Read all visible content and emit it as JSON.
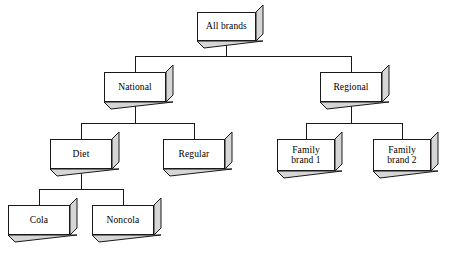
{
  "diagram": {
    "type": "hierarchy-tree",
    "title": "",
    "orientation": "top-down",
    "depth": 4,
    "style": {
      "node_shape": "3d-extruded-box",
      "face_color": "#ffffff",
      "extrude_color": "#d6d6d6",
      "border_color": "#1a1a1a",
      "line_color": "#1a1a1a",
      "extrude_offset_px": 7
    },
    "nodes": [
      {
        "id": "all-brands",
        "label": "All brands",
        "level": 0,
        "parent": null,
        "x": 197,
        "y": 12,
        "w": 59,
        "h": 29
      },
      {
        "id": "national",
        "label": "National",
        "level": 1,
        "parent": "all-brands",
        "x": 104,
        "y": 72,
        "w": 62,
        "h": 30
      },
      {
        "id": "regional",
        "label": "Regional",
        "level": 1,
        "parent": "all-brands",
        "x": 320,
        "y": 72,
        "w": 62,
        "h": 30
      },
      {
        "id": "diet",
        "label": "Diet",
        "level": 2,
        "parent": "national",
        "x": 50,
        "y": 139,
        "w": 62,
        "h": 30
      },
      {
        "id": "regular",
        "label": "Regular",
        "level": 2,
        "parent": "national",
        "x": 163,
        "y": 139,
        "w": 62,
        "h": 30
      },
      {
        "id": "family-brand-1",
        "label": "Family\nbrand 1",
        "level": 2,
        "parent": "regional",
        "x": 277,
        "y": 139,
        "w": 58,
        "h": 32
      },
      {
        "id": "family-brand-2",
        "label": "Family\nbrand 2",
        "level": 2,
        "parent": "regional",
        "x": 373,
        "y": 139,
        "w": 58,
        "h": 32
      },
      {
        "id": "cola",
        "label": "Cola",
        "level": 3,
        "parent": "diet",
        "x": 8,
        "y": 205,
        "w": 62,
        "h": 30
      },
      {
        "id": "noncola",
        "label": "Noncola",
        "level": 3,
        "parent": "diet",
        "x": 92,
        "y": 205,
        "w": 62,
        "h": 30
      }
    ]
  }
}
